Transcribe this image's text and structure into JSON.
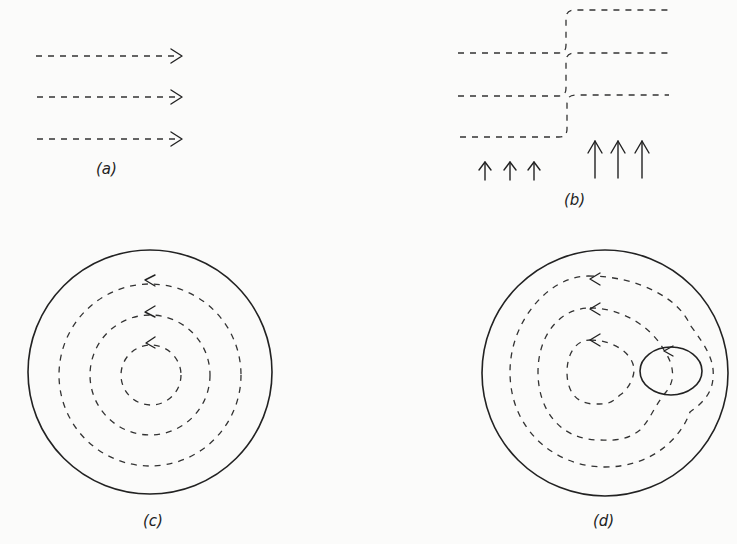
{
  "figure": {
    "panels": [
      {
        "id": "a",
        "label": "(a)",
        "description": "uniform parallel flow, three dashed streamlines with arrows pointing right"
      },
      {
        "id": "b",
        "label": "(b)",
        "description": "streamlines shifted upward across a step; small upward arrows on left, large upward arrows on right"
      },
      {
        "id": "c",
        "label": "(c)",
        "description": "circular container with three concentric dashed circular streamlines, arrows pointing left (counterclockwise)"
      },
      {
        "id": "d",
        "label": "(d)",
        "description": "circular container with concentric dashed streamlines deformed around an elliptical obstacle at right"
      }
    ],
    "colors": {
      "ink": "#222222",
      "background": "#fbfbfa"
    }
  }
}
